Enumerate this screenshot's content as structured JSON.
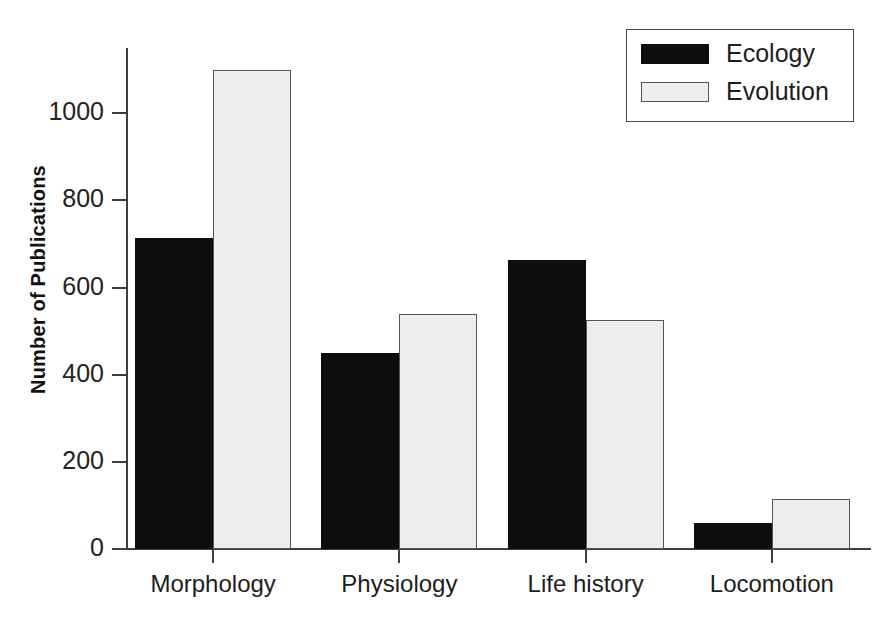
{
  "chart_data": {
    "type": "bar",
    "title": "",
    "xlabel": "",
    "ylabel": "Number of Publications",
    "categories": [
      "Morphology",
      "Physiology",
      "Life history",
      "Locomotion"
    ],
    "series": [
      {
        "name": "Ecology",
        "color": "#0d0d0d",
        "values": [
          715,
          450,
          663,
          60
        ]
      },
      {
        "name": "Evolution",
        "color": "#ededed",
        "values": [
          1100,
          540,
          525,
          115
        ]
      }
    ],
    "ylim": [
      0,
      1150
    ],
    "yticks": [
      0,
      200,
      400,
      600,
      800,
      1000
    ],
    "ytick_labels": [
      "0",
      "200",
      "400",
      "600",
      "800",
      "1000"
    ],
    "grid": false,
    "legend_position": "top-right",
    "legend_entries": [
      "Ecology",
      "Evolution"
    ],
    "bar_group_mode": "grouped"
  },
  "axes": {
    "y_title": "Number of Publications"
  },
  "legend": {
    "items": [
      {
        "label": "Ecology"
      },
      {
        "label": "Evolution"
      }
    ]
  }
}
